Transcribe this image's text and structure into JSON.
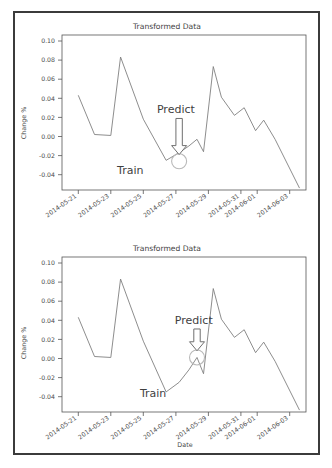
{
  "figure": {
    "width": 332,
    "height": 468,
    "frame_color": "#3b3b3b",
    "background": "#ffffff"
  },
  "charts": [
    {
      "id": "chart-top",
      "title": "Transformed Data",
      "ylabel": "Change %",
      "xlabel": "",
      "annotations": {
        "train_label": "Train",
        "predict_label": "Predict"
      }
    },
    {
      "id": "chart-bottom",
      "title": "Transformed Data",
      "ylabel": "Change %",
      "xlabel": "Date",
      "annotations": {
        "train_label": "Train",
        "predict_label": "Predict"
      }
    }
  ],
  "chart_data": [
    {
      "type": "line",
      "title": "Transformed Data",
      "xlabel": "",
      "ylabel": "Change %",
      "grid": false,
      "legend": null,
      "line_color": "#808080",
      "ylim": [
        -0.052,
        0.11
      ],
      "yticks": [
        0.1,
        0.08,
        0.06,
        0.04,
        0.02,
        0.0,
        -0.02,
        -0.04
      ],
      "ytick_labels": [
        "0.10",
        "0.08",
        "0.06",
        "0.04",
        "0.02",
        "0.00",
        "-0.02",
        "-0.04"
      ],
      "xtick_labels": [
        "2014-05-21",
        "2014-05-23",
        "2014-05-25",
        "2014-05-27",
        "2014-05-29",
        "2014-05-31",
        "2014-06-01",
        "2014-06-03"
      ],
      "xtick_positions": [
        1,
        3,
        5,
        7,
        9,
        11,
        12,
        14
      ],
      "xlim": [
        0,
        15
      ],
      "x": [
        1,
        2,
        3,
        3.6,
        5,
        6.4,
        7.2,
        7.8,
        8.3,
        8.7,
        9.3,
        9.8,
        10.6,
        11.2,
        11.9,
        12.4,
        13.1,
        14.6
      ],
      "values": [
        0.047,
        0.006,
        0.005,
        0.087,
        0.022,
        -0.021,
        -0.013,
        -0.006,
        0.001,
        -0.012,
        0.077,
        0.045,
        0.026,
        0.034,
        0.01,
        0.021,
        0.001,
        -0.05
      ],
      "predict_marker": {
        "x": 7.2,
        "y": -0.022,
        "style": "open-circle"
      },
      "annotations": [
        {
          "text": "Predict",
          "x": 7.0,
          "y": 0.028,
          "arrow_to_x": 7.2,
          "arrow_to_y": -0.015
        },
        {
          "text": "Train",
          "x": 4.2,
          "y": -0.035
        }
      ]
    },
    {
      "type": "line",
      "title": "Transformed Data",
      "xlabel": "Date",
      "ylabel": "Change %",
      "grid": false,
      "legend": null,
      "line_color": "#808080",
      "ylim": [
        -0.052,
        0.11
      ],
      "yticks": [
        0.1,
        0.08,
        0.06,
        0.04,
        0.02,
        0.0,
        -0.02,
        -0.04
      ],
      "ytick_labels": [
        "0.10",
        "0.08",
        "0.06",
        "0.04",
        "0.02",
        "0.00",
        "-0.02",
        "-0.04"
      ],
      "xtick_labels": [
        "2014-05-21",
        "2014-05-23",
        "2014-05-25",
        "2014-05-27",
        "2014-05-29",
        "2014-05-31",
        "2014-06-01",
        "2014-06-03"
      ],
      "xtick_positions": [
        1,
        3,
        5,
        7,
        9,
        11,
        12,
        14
      ],
      "xlim": [
        0,
        15
      ],
      "x": [
        1,
        2,
        3,
        3.6,
        5,
        6.4,
        7.2,
        7.8,
        8.3,
        8.7,
        9.3,
        9.8,
        10.6,
        11.2,
        11.9,
        12.4,
        13.1,
        14.6
      ],
      "values": [
        0.047,
        0.006,
        0.005,
        0.087,
        0.022,
        -0.031,
        -0.021,
        -0.008,
        0.005,
        -0.012,
        0.077,
        0.045,
        0.026,
        0.034,
        0.01,
        0.021,
        0.001,
        -0.05
      ],
      "predict_marker": {
        "x": 8.3,
        "y": 0.005,
        "style": "open-circle"
      },
      "annotations": [
        {
          "text": "Predict",
          "x": 8.1,
          "y": 0.04,
          "arrow_to_x": 8.3,
          "arrow_to_y": 0.012
        },
        {
          "text": "Train",
          "x": 5.6,
          "y": -0.036
        }
      ]
    }
  ]
}
